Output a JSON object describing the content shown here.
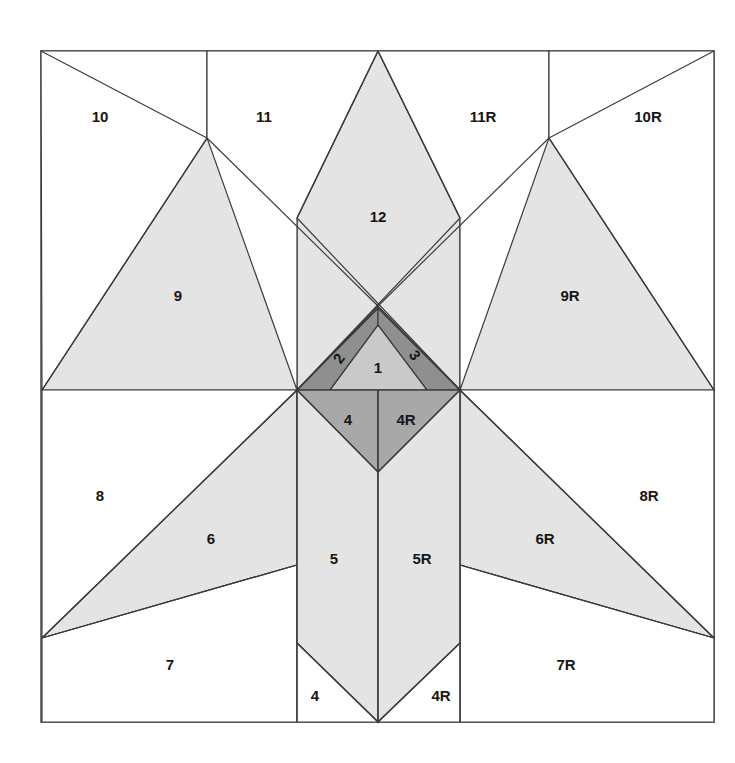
{
  "figure": {
    "type": "geometric-crease-pattern",
    "symmetry_axis_x": 378,
    "square": {
      "left": 41,
      "top": 51,
      "right": 714,
      "bottom": 722
    }
  },
  "palette": {
    "page_background": "#ffffff",
    "stroke": "#3c3c3c",
    "border_stroke": "#555555",
    "fill_white": "#ffffff",
    "fill_light": "#e4e4e4",
    "fill_medium": "#c9c9c9",
    "fill_dark": "#a8a8a8",
    "fill_darker": "#8f8f8f",
    "label_color": "#161616"
  },
  "regions": [
    {
      "id": "r1",
      "label": "1",
      "shade": "fill_medium",
      "label_x": 378,
      "label_y": 369,
      "rotation": 0
    },
    {
      "id": "r2",
      "label": "2",
      "shade": "fill_darker",
      "label_x": 340,
      "label_y": 359,
      "rotation": -45
    },
    {
      "id": "r3",
      "label": "3",
      "shade": "fill_darker",
      "label_x": 414,
      "label_y": 356,
      "rotation": 45
    },
    {
      "id": "r4",
      "label": "4",
      "shade": "fill_dark",
      "label_x": 348,
      "label_y": 421,
      "rotation": 0
    },
    {
      "id": "r4R",
      "label": "4R",
      "shade": "fill_dark",
      "label_x": 406,
      "label_y": 421,
      "rotation": 0
    },
    {
      "id": "r5",
      "label": "5",
      "shade": "fill_light",
      "label_x": 334,
      "label_y": 560,
      "rotation": 0
    },
    {
      "id": "r5R",
      "label": "5R",
      "shade": "fill_light",
      "label_x": 422,
      "label_y": 560,
      "rotation": 0
    },
    {
      "id": "r4b",
      "label": "4",
      "shade": "fill_white",
      "label_x": 315,
      "label_y": 697,
      "rotation": 0
    },
    {
      "id": "r4Rb",
      "label": "4R",
      "shade": "fill_white",
      "label_x": 441,
      "label_y": 697,
      "rotation": 0
    },
    {
      "id": "r6",
      "label": "6",
      "shade": "fill_light",
      "label_x": 211,
      "label_y": 540,
      "rotation": 0
    },
    {
      "id": "r6R",
      "label": "6R",
      "shade": "fill_light",
      "label_x": 545,
      "label_y": 540,
      "rotation": 0
    },
    {
      "id": "r7",
      "label": "7",
      "shade": "fill_white",
      "label_x": 170,
      "label_y": 666,
      "rotation": 0
    },
    {
      "id": "r7R",
      "label": "7R",
      "shade": "fill_white",
      "label_x": 566,
      "label_y": 666,
      "rotation": 0
    },
    {
      "id": "r8",
      "label": "8",
      "shade": "fill_white",
      "label_x": 100,
      "label_y": 497,
      "rotation": 0
    },
    {
      "id": "r8R",
      "label": "8R",
      "shade": "fill_white",
      "label_x": 649,
      "label_y": 497,
      "rotation": 0
    },
    {
      "id": "r9",
      "label": "9",
      "shade": "fill_light",
      "label_x": 178,
      "label_y": 297,
      "rotation": 0
    },
    {
      "id": "r9R",
      "label": "9R",
      "shade": "fill_light",
      "label_x": 570,
      "label_y": 297,
      "rotation": 0
    },
    {
      "id": "r10",
      "label": "10",
      "shade": "fill_white",
      "label_x": 100,
      "label_y": 118,
      "rotation": 0
    },
    {
      "id": "r10R",
      "label": "10R",
      "shade": "fill_white",
      "label_x": 648,
      "label_y": 118,
      "rotation": 0
    },
    {
      "id": "r11",
      "label": "11",
      "shade": "fill_white",
      "label_x": 264,
      "label_y": 118,
      "rotation": 0
    },
    {
      "id": "r11R",
      "label": "11R",
      "shade": "fill_white",
      "label_x": 483,
      "label_y": 118,
      "rotation": 0
    },
    {
      "id": "r12",
      "label": "12",
      "shade": "fill_light",
      "label_x": 378,
      "label_y": 218,
      "rotation": 0
    }
  ]
}
